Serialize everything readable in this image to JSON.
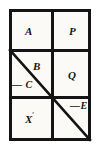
{
  "figure": {
    "type": "grid-diagram",
    "background_color": "#fbfaf7",
    "line_color": "#141414",
    "frame": {
      "x": 9,
      "y": 9,
      "width": 82,
      "height": 132,
      "stroke_width": 3
    },
    "dividers": [
      {
        "name": "vertical-main",
        "orientation": "vertical",
        "x": 51,
        "y": 9,
        "length": 132
      },
      {
        "name": "horizontal-upper",
        "orientation": "horizontal",
        "x": 9,
        "y": 49,
        "length": 82
      },
      {
        "name": "horizontal-lower-left",
        "orientation": "horizontal",
        "x": 9,
        "y": 96,
        "length": 45
      },
      {
        "name": "horizontal-lower-right",
        "orientation": "horizontal",
        "x": 51,
        "y": 96,
        "length": 40
      }
    ],
    "diagonal": {
      "name": "diagonal-line",
      "x1": 10,
      "y1": 50,
      "x2": 90,
      "y2": 140,
      "stroke_width": 2.6,
      "color": "#141414"
    },
    "labels": {
      "top_left": "A",
      "top_right": "P",
      "middle_left_upper": "B",
      "middle_left_lower": "— C",
      "middle_right": "Q",
      "bottom_left_base": "X",
      "bottom_left_prime": "′",
      "bottom_right": "—E"
    }
  }
}
